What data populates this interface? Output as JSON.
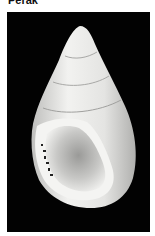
{
  "caption": {
    "text": "Perak"
  },
  "photo": {
    "subject": "shell-specimen",
    "background_color": "#020202",
    "shell_color": "#e6e6e4"
  }
}
